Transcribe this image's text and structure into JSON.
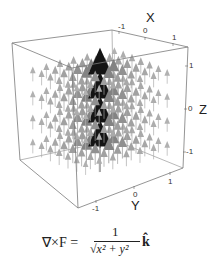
{
  "figure": {
    "axes": {
      "x": {
        "label": "x",
        "ticks": [
          "-1",
          "0",
          "1"
        ]
      },
      "y": {
        "label": "y",
        "ticks": [
          "-1",
          "0",
          "1"
        ]
      },
      "z": {
        "label": "z",
        "ticks": [
          "1",
          "0",
          "-1"
        ]
      }
    },
    "formula": {
      "lhs": "∇×F =",
      "numerator": "1",
      "denominator": "√x² + y²",
      "unit_vector": "k̂"
    },
    "colors": {
      "box": "#8a8a8a",
      "arrow_dark": "#1a1a1a",
      "arrow_mid": "#707070",
      "arrow_light": "#c4c4c4"
    }
  }
}
